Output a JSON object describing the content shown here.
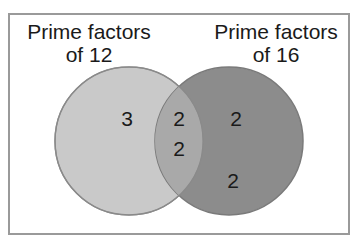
{
  "diagram": {
    "type": "venn",
    "sets": [
      {
        "id": "A",
        "label_line1": "Prime factors",
        "label_line2": "of 12",
        "only_items": [
          "3"
        ],
        "color": "#c9c9c9"
      },
      {
        "id": "B",
        "label_line1": "Prime factors",
        "label_line2": "of 16",
        "only_items": [
          "2",
          "2"
        ],
        "color": "#8c8c8c"
      }
    ],
    "intersection": {
      "items": [
        "2",
        "2"
      ],
      "color": "#a9a9a9"
    },
    "border_color": "#9a9a9a",
    "circle_stroke": "#8a8a8a"
  }
}
